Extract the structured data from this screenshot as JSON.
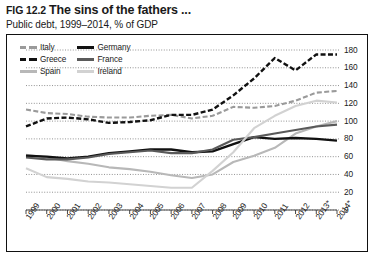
{
  "header": {
    "fig_number": "FIG 12.2",
    "title": "The sins of the fathers ...",
    "subtitle": "Public debt, 1999–2014, % of GDP"
  },
  "legend": {
    "column_1": [
      {
        "label": "Italy",
        "color": "#9a9a9a",
        "style": "dashed",
        "width": 3
      },
      {
        "label": "Greece",
        "color": "#111111",
        "style": "dashed",
        "width": 3
      },
      {
        "label": "Spain",
        "color": "#b8b8b8",
        "style": "solid",
        "width": 3
      }
    ],
    "column_2": [
      {
        "label": "Germany",
        "color": "#111111",
        "style": "solid",
        "width": 3
      },
      {
        "label": "France",
        "color": "#5a5a5a",
        "style": "solid",
        "width": 3
      },
      {
        "label": "Ireland",
        "color": "#d2d2d2",
        "style": "solid",
        "width": 3
      }
    ]
  },
  "chart_data": {
    "type": "line",
    "title": "The sins of the fathers ...",
    "subtitle": "Public debt, 1999–2014, % of GDP",
    "xlabel": "",
    "ylabel": "% of GDP",
    "ylim": [
      0,
      180
    ],
    "yticks": [
      0,
      20,
      40,
      60,
      80,
      100,
      120,
      140,
      160,
      180
    ],
    "y_axis_position": "right",
    "grid": "horizontal-dotted",
    "legend_position": "top-left",
    "footnote": "* forecast",
    "categories": [
      "1999",
      "2000",
      "2001",
      "2002",
      "2003",
      "2004",
      "2005",
      "2006",
      "2007",
      "2008",
      "2009",
      "2010",
      "2011",
      "2012",
      "2013*",
      "2014*"
    ],
    "series": [
      {
        "name": "Italy",
        "color": "#9a9a9a",
        "style": "dashed",
        "values": [
          113,
          109,
          108,
          105,
          104,
          104,
          106,
          107,
          103,
          106,
          116,
          115,
          117,
          123,
          132,
          134
        ]
      },
      {
        "name": "Greece",
        "color": "#111111",
        "style": "dashed",
        "values": [
          94,
          103,
          104,
          102,
          98,
          99,
          101,
          107,
          107,
          113,
          129,
          148,
          171,
          157,
          175,
          175
        ]
      },
      {
        "name": "Spain",
        "color": "#b8b8b8",
        "style": "solid",
        "values": [
          62,
          59,
          55,
          52,
          48,
          46,
          43,
          39,
          36,
          40,
          54,
          61,
          70,
          86,
          94,
          100
        ]
      },
      {
        "name": "Germany",
        "color": "#111111",
        "style": "solid",
        "values": [
          61,
          60,
          58,
          60,
          64,
          66,
          68,
          68,
          65,
          66,
          74,
          82,
          80,
          81,
          80,
          78
        ]
      },
      {
        "name": "France",
        "color": "#5a5a5a",
        "style": "solid",
        "values": [
          59,
          57,
          57,
          59,
          63,
          65,
          67,
          64,
          64,
          68,
          79,
          82,
          86,
          90,
          94,
          96
        ]
      },
      {
        "name": "Ireland",
        "color": "#d2d2d2",
        "style": "solid",
        "values": [
          47,
          37,
          35,
          32,
          31,
          29,
          27,
          25,
          25,
          44,
          65,
          92,
          106,
          117,
          123,
          121
        ]
      }
    ]
  }
}
